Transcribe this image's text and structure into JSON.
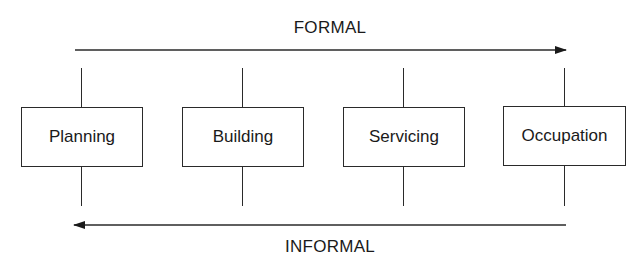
{
  "diagram": {
    "top_arrow": {
      "label": "FORMAL",
      "direction": "right"
    },
    "bottom_arrow": {
      "label": "INFORMAL",
      "direction": "left"
    },
    "stages": [
      {
        "label": "Planning"
      },
      {
        "label": "Building"
      },
      {
        "label": "Servicing"
      },
      {
        "label": "Occupation"
      }
    ],
    "colors": {
      "line": "#2a2a2a",
      "text": "#1a1a1a",
      "background": "#ffffff"
    }
  }
}
